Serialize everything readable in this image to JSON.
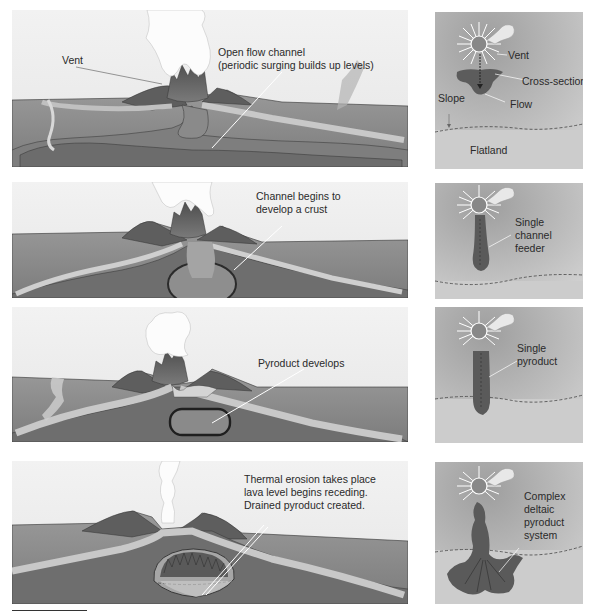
{
  "figure": {
    "colors": {
      "sky": "#eeeeee",
      "ground": "#8f8f8f",
      "ground_dark": "#6e6e6e",
      "flow_light": "#c4c4c4",
      "cone": "#5c5c5c",
      "plume": "#fafafa",
      "plan_bg_top": "#b5b5b5",
      "plan_bg_bottom": "#cfcfcf",
      "plan_flow": "#5a5a5a",
      "dashed_line": "#444444",
      "text": "#2a2a2a"
    },
    "stages": [
      {
        "index": 1,
        "cross_section": {
          "labels": {
            "vent": "Vent",
            "channel_line1": "Open flow channel",
            "channel_line2": "(periodic surging builds up levels)"
          }
        },
        "plan_view": {
          "labels": {
            "vent": "Vent",
            "cross_section": "Cross-section",
            "slope": "Slope",
            "flow": "Flow",
            "flatland": "Flatland"
          }
        }
      },
      {
        "index": 2,
        "cross_section": {
          "labels": {
            "line1": "Channel begins to",
            "line2": "develop a crust"
          }
        },
        "plan_view": {
          "labels": {
            "line1": "Single",
            "line2": "channel",
            "line3": "feeder"
          }
        }
      },
      {
        "index": 3,
        "cross_section": {
          "labels": {
            "line1": "Pyroduct develops"
          }
        },
        "plan_view": {
          "labels": {
            "line1": "Single",
            "line2": "pyroduct"
          }
        }
      },
      {
        "index": 4,
        "cross_section": {
          "labels": {
            "line1": "Thermal erosion takes place",
            "line2": "lava level begins receding.",
            "line3": "Drained pyroduct created."
          }
        },
        "plan_view": {
          "labels": {
            "line1": "Complex",
            "line2": "deltaic",
            "line3": "pyroduct",
            "line4": "system"
          }
        }
      }
    ]
  }
}
